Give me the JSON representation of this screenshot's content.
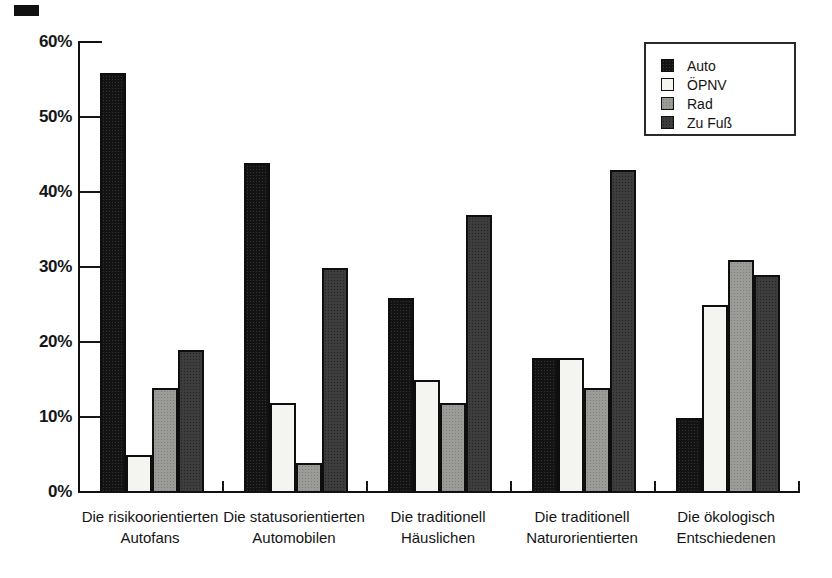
{
  "page": {
    "background": "#ffffff"
  },
  "colors": {
    "axis": "#111111",
    "text": "#141414",
    "auto_bar": "#131313",
    "oepnv_bar": "#f4f4f0",
    "rad_bar": "#9b9b98",
    "zu_fuss_bar": "#3d3d3d"
  },
  "chart_data": {
    "type": "bar",
    "title": "",
    "categories": [
      "Die risikoorientierten Autofans",
      "Die statusorientierten Automobilen",
      "Die traditionell Häuslichen",
      "Die traditionell Naturorientierten",
      "Die ökologisch Entschiedenen"
    ],
    "series": [
      {
        "name": "Auto",
        "key": "auto",
        "color": "#131313",
        "values": [
          56,
          44,
          26,
          18,
          10
        ]
      },
      {
        "name": "ÖPNV",
        "key": "oepnv",
        "color": "#f4f4f0",
        "values": [
          5,
          12,
          15,
          18,
          25
        ]
      },
      {
        "name": "Rad",
        "key": "rad",
        "color": "#9b9b98",
        "values": [
          14,
          4,
          12,
          14,
          31
        ]
      },
      {
        "name": "Zu Fuß",
        "key": "zu-fuss",
        "color": "#3d3d3d",
        "values": [
          19,
          30,
          37,
          43,
          29
        ]
      }
    ],
    "ylabel": "",
    "xlabel": "",
    "ylim": [
      0,
      60
    ],
    "ytick_step": 10,
    "ytick_labels": [
      "60%",
      "50%",
      "40%",
      "30%",
      "20%",
      "10%",
      "0%"
    ],
    "unit": "%",
    "grid": false,
    "legend_position": "top-right"
  }
}
